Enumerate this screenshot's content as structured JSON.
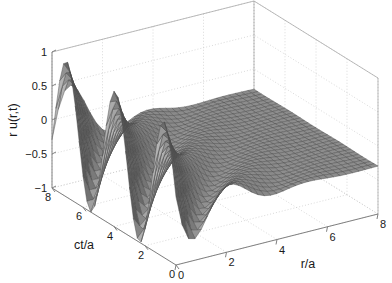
{
  "figure": {
    "type": "surface-plot-3d",
    "background_color": "#ffffff",
    "axis_line_color": "#808080",
    "grid_color": "#c8c8c8",
    "mesh_line_color": "#4d4d4d",
    "surface_color_light": "#b4b4b4",
    "surface_color_dark": "#5a5a5a"
  },
  "chart_data": {
    "type": "surface",
    "title": "",
    "xlabel": "r/a",
    "ylabel": "ct/a",
    "zlabel": "r u(r,t)",
    "xlim": [
      0,
      8
    ],
    "ylim": [
      0,
      8
    ],
    "zlim": [
      -1,
      1
    ],
    "xticks": [
      0,
      2,
      4,
      6,
      8
    ],
    "yticks": [
      0,
      2,
      4,
      6,
      8
    ],
    "zticks": [
      -1,
      -0.5,
      0,
      0.5,
      1
    ],
    "xtick_labels": [
      "0",
      "2",
      "4",
      "6",
      "8"
    ],
    "ytick_labels": [
      "0",
      "2",
      "4",
      "6",
      "8"
    ],
    "ztick_labels": [
      "-1",
      "-0.5",
      "0",
      "0.5",
      "1"
    ],
    "grid": true,
    "legend": null,
    "colormap": "gray",
    "view_azimuth": -37.5,
    "view_elevation": 30,
    "x": [
      0,
      0.25,
      0.5,
      0.75,
      1,
      1.25,
      1.5,
      1.75,
      2,
      2.25,
      2.5,
      2.75,
      3,
      3.25,
      3.5,
      3.75,
      4,
      4.25,
      4.5,
      4.75,
      5,
      5.25,
      5.5,
      5.75,
      6,
      6.25,
      6.5,
      6.75,
      7,
      7.25,
      7.5,
      7.75,
      8
    ],
    "y": [
      0,
      0.25,
      0.5,
      0.75,
      1,
      1.25,
      1.5,
      1.75,
      2,
      2.25,
      2.5,
      2.75,
      3,
      3.25,
      3.5,
      3.75,
      4,
      4.25,
      4.5,
      4.75,
      5,
      5.25,
      5.5,
      5.75,
      6,
      6.25,
      6.5,
      6.75,
      7,
      7.25,
      7.5,
      7.75,
      8
    ]
  },
  "axes": {
    "z": {
      "label": "r u(r,t)",
      "ticks": [
        "1",
        "0.5",
        "0",
        "-0.5",
        "-1"
      ]
    },
    "y": {
      "label": "ct/a",
      "ticks": [
        "8",
        "6",
        "4",
        "2",
        "0"
      ]
    },
    "x": {
      "label": "r/a",
      "ticks": [
        "0",
        "2",
        "4",
        "6",
        "8"
      ]
    }
  }
}
